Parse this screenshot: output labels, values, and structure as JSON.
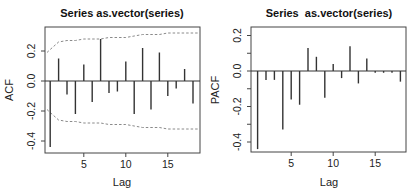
{
  "chart_data": [
    {
      "type": "bar",
      "subtype": "correlogram",
      "title": "Series as.vector(series)",
      "xlabel": "Lag",
      "ylabel": "ACF",
      "xlim": [
        0.4,
        18.6
      ],
      "ylim": [
        -0.48,
        0.36
      ],
      "xticks": [
        5,
        10,
        15
      ],
      "yticks": [
        -0.4,
        -0.2,
        0.0,
        0.2
      ],
      "ytick_labels": [
        "-0.4",
        "-0.2",
        "0.0",
        "0.2"
      ],
      "grid": false,
      "lags": [
        1,
        2,
        3,
        4,
        5,
        6,
        7,
        8,
        9,
        10,
        11,
        12,
        13,
        14,
        15,
        16,
        17,
        18
      ],
      "values": [
        -0.44,
        0.15,
        -0.09,
        -0.22,
        0.11,
        -0.14,
        0.28,
        -0.08,
        -0.07,
        0.13,
        -0.22,
        0.22,
        -0.19,
        0.19,
        -0.1,
        -0.05,
        0.08,
        -0.15
      ],
      "confidence_band": {
        "style": "dashed",
        "upper": [
          0.21,
          0.26,
          0.27,
          0.27,
          0.28,
          0.28,
          0.28,
          0.29,
          0.29,
          0.29,
          0.3,
          0.31,
          0.31,
          0.31,
          0.32,
          0.32,
          0.32,
          0.32
        ],
        "lower": [
          -0.21,
          -0.26,
          -0.27,
          -0.27,
          -0.28,
          -0.28,
          -0.28,
          -0.29,
          -0.29,
          -0.29,
          -0.3,
          -0.31,
          -0.31,
          -0.31,
          -0.32,
          -0.32,
          -0.32,
          -0.32
        ]
      }
    },
    {
      "type": "bar",
      "subtype": "correlogram",
      "title": "Series  as.vector(series)",
      "xlabel": "Lag",
      "ylabel": "PACF",
      "xlim": [
        0.4,
        18.6
      ],
      "ylim": [
        -0.46,
        0.26
      ],
      "xticks": [
        5,
        10,
        15
      ],
      "yticks": [
        -0.4,
        -0.2,
        0.0,
        0.2
      ],
      "ytick_labels": [
        "-0.4",
        "-0.2",
        "0.0",
        "0.2"
      ],
      "minor_yticks": [
        -0.3,
        -0.1,
        0.1
      ],
      "grid": false,
      "lags": [
        1,
        2,
        3,
        4,
        5,
        6,
        7,
        8,
        9,
        10,
        11,
        12,
        13,
        14,
        15,
        16,
        17,
        18
      ],
      "values": [
        -0.44,
        -0.05,
        -0.05,
        -0.33,
        -0.16,
        -0.19,
        0.13,
        0.08,
        -0.15,
        0.04,
        -0.04,
        0.14,
        -0.07,
        0.07,
        -0.01,
        -0.01,
        -0.01,
        -0.06
      ]
    }
  ],
  "plots": {
    "acf": {
      "box": {
        "x": 45,
        "y": 27,
        "w": 155,
        "h": 126
      },
      "zero_y": 81,
      "px_per_unit": 150,
      "lag1_x": 50.2,
      "px_per_lag": 8.4
    },
    "pacf": {
      "box": {
        "x": 251,
        "y": 27,
        "w": 155,
        "h": 125
      },
      "zero_y": 71,
      "px_per_unit": 177.5,
      "lag1_x": 257.6,
      "px_per_lag": 8.4
    }
  },
  "colors": {
    "bar": "#333333",
    "axis": "#444444",
    "band": "#8a8a8a",
    "text": "#111111"
  }
}
